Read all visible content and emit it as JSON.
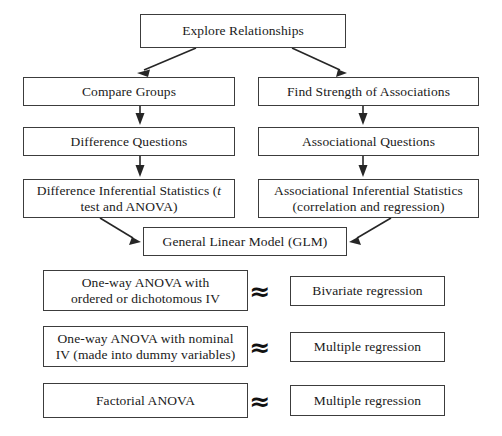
{
  "diagram": {
    "title": "Explore Relationships",
    "nodes": {
      "root": "Explore Relationships",
      "compare_groups": "Compare Groups",
      "find_strength": "Find Strength of Associations",
      "difference_questions": "Difference Questions",
      "associational_questions": "Associational Questions",
      "difference_stats_line1": "Difference Inferential Statistics (",
      "difference_stats_italic": "t",
      "difference_stats_line2": "test and ANOVA)",
      "associational_stats_line1": "Associational Inferential Statistics",
      "associational_stats_line2": "(correlation and regression)",
      "glm": "General Linear Model (GLM)",
      "oneway_ordered_line1": "One-way ANOVA with",
      "oneway_ordered_line2": "ordered or dichotomous IV",
      "bivariate_regression": "Bivariate regression",
      "oneway_nominal_line1": "One-way ANOVA with nominal",
      "oneway_nominal_line2": "IV  (made into dummy variables)",
      "multiple_regression_1": "Multiple regression",
      "factorial_anova": "Factorial ANOVA",
      "multiple_regression_2": "Multiple regression"
    },
    "equivalence_symbol": "≈",
    "colors": {
      "border": "#3c3c3c",
      "text": "#1a1a1a",
      "arrow": "#262626",
      "background": "#ffffff"
    }
  }
}
